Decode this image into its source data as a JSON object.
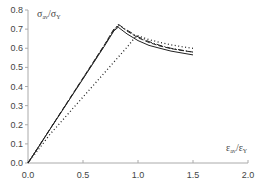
{
  "chart_data": {
    "type": "line",
    "title": "",
    "xlabel": "ε_av/ε_Y",
    "ylabel": "σ_av/σ_Y",
    "xlim": [
      0,
      2.0
    ],
    "ylim": [
      0,
      0.8
    ],
    "x_ticks": [
      "0.0",
      "0.5",
      "1.0",
      "1.5",
      "2.0"
    ],
    "y_ticks": [
      "0.0",
      "0.1",
      "0.2",
      "0.3",
      "0.4",
      "0.5",
      "0.6",
      "0.7",
      "0.8"
    ],
    "grid": false,
    "legend": "none",
    "series": [
      {
        "name": "solid",
        "style": "solid",
        "x": [
          0,
          0.1,
          0.2,
          0.3,
          0.4,
          0.5,
          0.6,
          0.7,
          0.78,
          0.82,
          0.9,
          1.0,
          1.1,
          1.2,
          1.3,
          1.4,
          1.5
        ],
        "y": [
          0,
          0.088,
          0.176,
          0.264,
          0.352,
          0.44,
          0.528,
          0.616,
          0.69,
          0.71,
          0.675,
          0.64,
          0.615,
          0.6,
          0.585,
          0.575,
          0.565
        ]
      },
      {
        "name": "dashed",
        "style": "dashed",
        "x": [
          0,
          0.1,
          0.2,
          0.3,
          0.4,
          0.5,
          0.6,
          0.7,
          0.78,
          0.83,
          0.9,
          1.0,
          1.1,
          1.2,
          1.3,
          1.4,
          1.5
        ],
        "y": [
          0,
          0.089,
          0.178,
          0.267,
          0.356,
          0.445,
          0.534,
          0.623,
          0.7,
          0.72,
          0.69,
          0.655,
          0.63,
          0.612,
          0.598,
          0.588,
          0.58
        ]
      },
      {
        "name": "dash-dot",
        "style": "dashdot",
        "x": [
          0,
          0.1,
          0.2,
          0.3,
          0.4,
          0.5,
          0.6,
          0.7,
          0.78,
          0.82,
          0.9,
          1.0,
          1.1,
          1.2,
          1.3,
          1.4,
          1.5
        ],
        "y": [
          0,
          0.088,
          0.177,
          0.265,
          0.354,
          0.442,
          0.53,
          0.62,
          0.695,
          0.725,
          0.695,
          0.66,
          0.635,
          0.615,
          0.6,
          0.59,
          0.58
        ]
      },
      {
        "name": "dotted",
        "style": "dotted",
        "x": [
          0,
          0.1,
          0.2,
          0.3,
          0.4,
          0.5,
          0.6,
          0.7,
          0.8,
          0.9,
          0.97,
          1.0,
          1.1,
          1.2,
          1.3,
          1.4,
          1.5
        ],
        "y": [
          0,
          0.075,
          0.15,
          0.215,
          0.28,
          0.345,
          0.41,
          0.475,
          0.54,
          0.605,
          0.655,
          0.665,
          0.645,
          0.63,
          0.618,
          0.608,
          0.6
        ]
      }
    ]
  },
  "axes": {
    "x_title_main": "ε",
    "x_title_sub": "av",
    "x_title_den": "ε",
    "x_title_den_sub": "Y",
    "y_title_main": "σ",
    "y_title_sub": "av",
    "y_title_den": "σ",
    "y_title_den_sub": "Y"
  }
}
